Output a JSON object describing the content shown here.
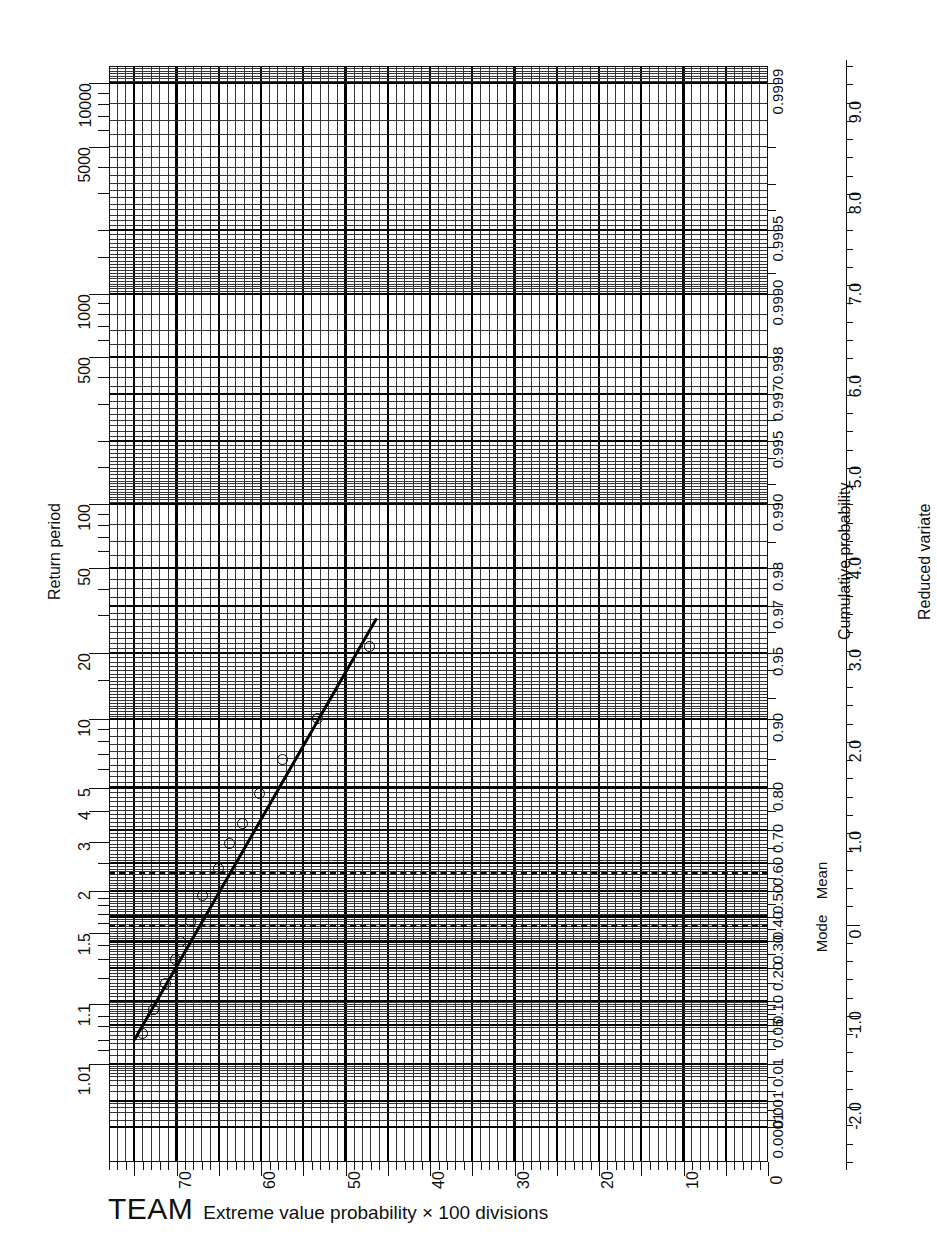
{
  "chart_data": {
    "type": "scatter",
    "title": "",
    "caption_brand": "TEAM",
    "caption_text": "Extreme value probability × 100 divisions",
    "grid": true,
    "paper": "Gumbel extreme value probability paper, 100 divisions",
    "x": {
      "label": "",
      "tick_labels": [
        "70",
        "60",
        "50",
        "40",
        "30",
        "20",
        "10",
        "0"
      ],
      "tick_values": [
        70,
        60,
        50,
        40,
        30,
        20,
        10,
        0
      ],
      "direction": "decreasing-left-to-right",
      "range": [
        78,
        0
      ]
    },
    "y_left": {
      "label": "Return period",
      "tick_labels": [
        "1.01",
        "1.1",
        "1.5",
        "2",
        "3",
        "4",
        "5",
        "10",
        "20",
        "50",
        "100",
        "500",
        "1000",
        "5000",
        "10000"
      ],
      "tick_values": [
        1.01,
        1.1,
        1.5,
        2,
        3,
        4,
        5,
        10,
        20,
        50,
        100,
        500,
        1000,
        5000,
        10000
      ]
    },
    "y_right": {
      "label": "Cumulative probability",
      "tick_labels": [
        "0.0001",
        "0.001",
        "0.01",
        "0.05",
        "0.10",
        "0.20",
        "0.30",
        "0.40",
        "0.50",
        "0.60",
        "0.70",
        "0.80",
        "0.90",
        "0.95",
        "0.97",
        "0.98",
        "0.990",
        "0.995",
        "0.997",
        "0.998",
        "0.9990",
        "0.9995",
        "0.9999"
      ],
      "tick_values": [
        0.0001,
        0.001,
        0.01,
        0.05,
        0.1,
        0.2,
        0.3,
        0.4,
        0.5,
        0.6,
        0.7,
        0.8,
        0.9,
        0.95,
        0.97,
        0.98,
        0.99,
        0.995,
        0.997,
        0.998,
        0.999,
        0.9995,
        0.9999
      ],
      "annotations": [
        {
          "text": "Mode",
          "probability": 0.3679
        },
        {
          "text": "Mean",
          "probability": 0.5704
        }
      ]
    },
    "y_far_right": {
      "label": "Reduced variate",
      "tick_labels": [
        "-2.0",
        "-1.0",
        "0",
        "1.0",
        "2.0",
        "3.0",
        "4.0",
        "5.0",
        "6.0",
        "7.0",
        "8.0",
        "9.0"
      ],
      "tick_values": [
        -2.0,
        -1.0,
        0,
        1.0,
        2.0,
        3.0,
        4.0,
        5.0,
        6.0,
        7.0,
        8.0,
        9.0
      ],
      "range": [
        -2.6,
        9.4
      ]
    },
    "reference_lines": [
      {
        "name": "mean-line",
        "style": "dashed",
        "reduced_variate": 0.5772,
        "label": "Mean"
      },
      {
        "name": "mode-line",
        "style": "dashed",
        "reduced_variate": 0.0,
        "label": "Mode"
      }
    ],
    "fit_line": {
      "name": "gumbel-fit-line",
      "style": "solid",
      "from": {
        "x": 75.0,
        "reduced_variate": -1.27
      },
      "to": {
        "x": 46.3,
        "reduced_variate": 3.35
      }
    },
    "series": [
      {
        "name": "observations",
        "marker": "open-circle",
        "points": [
          {
            "x": 74.2,
            "reduced_variate": -1.18
          },
          {
            "x": 72.8,
            "reduced_variate": -0.92
          },
          {
            "x": 71.4,
            "reduced_variate": -0.63
          },
          {
            "x": 70.3,
            "reduced_variate": -0.37
          },
          {
            "x": 69.6,
            "reduced_variate": -0.18
          },
          {
            "x": 68.5,
            "reduced_variate": 0.04
          },
          {
            "x": 67.0,
            "reduced_variate": 0.33
          },
          {
            "x": 65.2,
            "reduced_variate": 0.62
          },
          {
            "x": 63.9,
            "reduced_variate": 0.9
          },
          {
            "x": 62.3,
            "reduced_variate": 1.12
          },
          {
            "x": 60.3,
            "reduced_variate": 1.45
          },
          {
            "x": 57.6,
            "reduced_variate": 1.82
          },
          {
            "x": 53.4,
            "reduced_variate": 2.27
          },
          {
            "x": 47.3,
            "reduced_variate": 3.05
          }
        ]
      }
    ]
  },
  "axes": {
    "left_title": "Return period",
    "prob_title": "Cumulative probability",
    "rv_title": "Reduced variate",
    "mode_label": "Mode",
    "mean_label": "Mean"
  },
  "caption": {
    "brand": "TEAM",
    "text": "Extreme value probability × 100 divisions"
  }
}
